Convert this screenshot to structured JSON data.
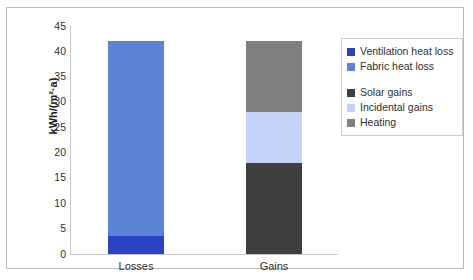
{
  "chart_data": {
    "type": "bar",
    "subtype": "stacked-column",
    "title": "",
    "xlabel": "",
    "ylabel": "kWh/(m²·a)",
    "ylim": [
      0,
      45
    ],
    "ytick_step": 5,
    "yticks": [
      "45",
      "40",
      "35",
      "30",
      "25",
      "20",
      "15",
      "10",
      "5",
      "0"
    ],
    "grid": false,
    "legend_position": "right",
    "categories": [
      "Losses",
      "Gains"
    ],
    "series": [
      {
        "name": "Ventilation heat loss",
        "color": "#2b44c4",
        "values": [
          3.5,
          0
        ]
      },
      {
        "name": "Fabric heat loss",
        "color": "#5b84d6",
        "values": [
          38.5,
          0
        ]
      },
      {
        "name": "Solar gains",
        "color": "#3f3f3f",
        "values": [
          0,
          18
        ]
      },
      {
        "name": "Incidental gains",
        "color": "#c5d2f7",
        "values": [
          0,
          10
        ]
      },
      {
        "name": "Heating",
        "color": "#808080",
        "values": [
          0,
          14
        ]
      }
    ],
    "totals": [
      42,
      42
    ]
  },
  "legend": {
    "entries": [
      {
        "label": "Ventilation heat loss",
        "color": "#2b44c4"
      },
      {
        "label": "Fabric heat loss",
        "color": "#5b84d6"
      },
      {
        "label": "Solar gains",
        "color": "#3f3f3f"
      },
      {
        "label": "Incidental gains",
        "color": "#c5d2f7"
      },
      {
        "label": "Heating",
        "color": "#808080"
      }
    ]
  }
}
